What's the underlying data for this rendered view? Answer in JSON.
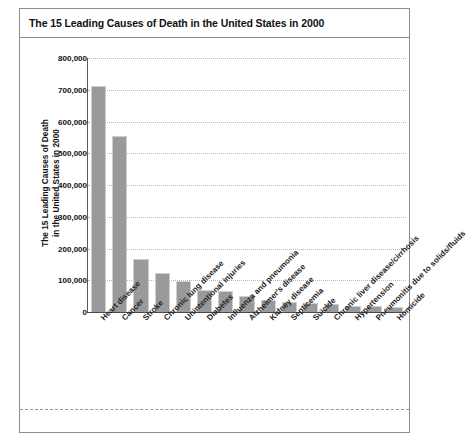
{
  "title": "The 15 Leading Causes of Death in the United States in 2000",
  "chart_data": {
    "type": "bar",
    "title": "The 15 Leading Causes of Death in the United States in 2000",
    "xlabel": "",
    "ylabel": "The 15 Leading Causes of Death in the United States in 2000",
    "ylabel_lines": [
      "The 15 Leading Causes of Death",
      "in the United States in 2000"
    ],
    "ylim": [
      0,
      800000
    ],
    "ytick_labels": [
      "800,000",
      "700,000",
      "600,000",
      "500,000",
      "400,000",
      "300,000",
      "200,000",
      "100,000",
      "0"
    ],
    "ytick_values": [
      800000,
      700000,
      600000,
      500000,
      400000,
      300000,
      200000,
      100000,
      0
    ],
    "grid": true,
    "legend": "none",
    "bar_color": "#9a9a9a",
    "categories": [
      "Heart disease",
      "Cancer",
      "Stroke",
      "Chronic lung disease",
      "Unintentional injuries",
      "Diabetes",
      "Influenza and pneumonia",
      "Alzheimer's disease",
      "Kidney disease",
      "Septicemia",
      "Suicide",
      "Chronic liver disease/cirrhosis",
      "Hypertension",
      "Pneumonitis due to solids/fluids",
      "Homicide"
    ],
    "values": [
      710760,
      553091,
      167661,
      122009,
      97900,
      69301,
      65313,
      49558,
      37251,
      31224,
      29350,
      26552,
      18073,
      17537,
      16765
    ]
  }
}
